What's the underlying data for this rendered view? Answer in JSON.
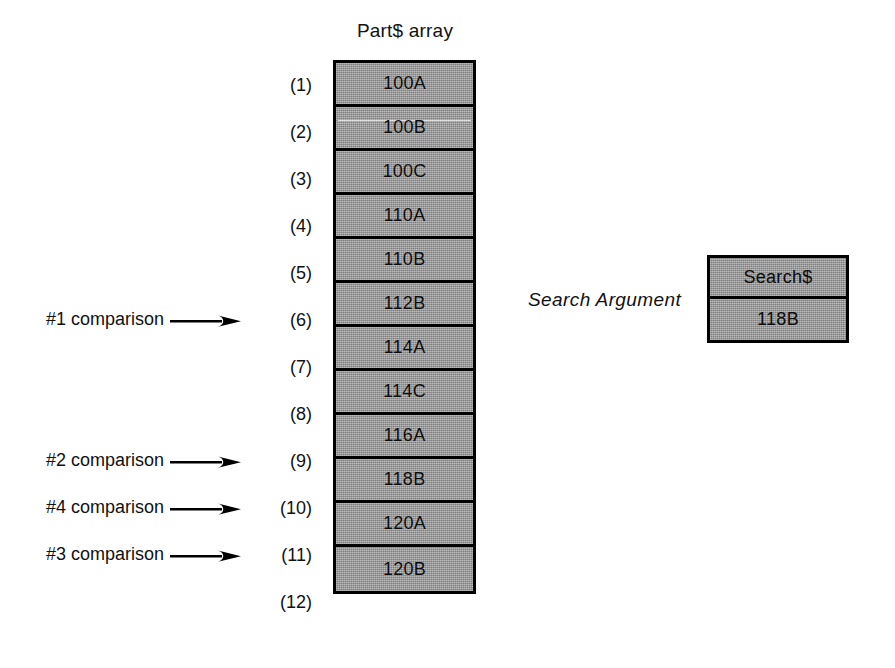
{
  "diagram": {
    "array": {
      "title": "Part$ array",
      "cells": [
        {
          "index": "(1)",
          "value": "100A"
        },
        {
          "index": "(2)",
          "value": "100B"
        },
        {
          "index": "(3)",
          "value": "100C"
        },
        {
          "index": "(4)",
          "value": "110A"
        },
        {
          "index": "(5)",
          "value": "110B"
        },
        {
          "index": "(6)",
          "value": "112B"
        },
        {
          "index": "(7)",
          "value": "114A"
        },
        {
          "index": "(8)",
          "value": "114C"
        },
        {
          "index": "(9)",
          "value": "116A"
        },
        {
          "index": "(10)",
          "value": "118B"
        },
        {
          "index": "(11)",
          "value": "120A"
        },
        {
          "index": "(12)",
          "value": "120B"
        }
      ]
    },
    "annotations": [
      {
        "label": "#1 comparison",
        "target_index": "(6)",
        "icon": "right-arrow-icon"
      },
      {
        "label": "#2 comparison",
        "target_index": "(9)",
        "icon": "right-arrow-icon"
      },
      {
        "label": "#4 comparison",
        "target_index": "(10)",
        "icon": "right-arrow-icon"
      },
      {
        "label": "#3 comparison",
        "target_index": "(11)",
        "icon": "right-arrow-icon"
      }
    ],
    "search_argument": {
      "label": "Search Argument",
      "variable_name": "Search$",
      "value": "118B"
    },
    "colors": {
      "cell_fill": "#9b9b9b",
      "border": "#000000",
      "text": "#111111",
      "background": "#ffffff"
    }
  }
}
